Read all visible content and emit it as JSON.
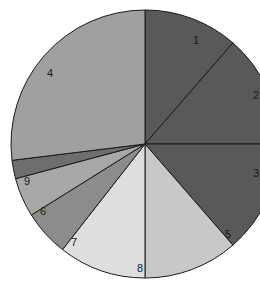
{
  "chart_data": {
    "type": "pie",
    "title": "",
    "subtitle": "",
    "xlabel": "",
    "ylabel": "",
    "legend": "none",
    "grid": false,
    "labels_visible": [
      "1",
      "2",
      "3",
      "4",
      "5",
      "6",
      "7",
      "8",
      "9"
    ],
    "note": "Grayscale pie chart with nine wedges labelled 1-9; wedge labels sit inside the slices. Wedges 2 and 3 labels are clipped by the right edge of the image.",
    "categories": [
      "1",
      "2",
      "3",
      "4",
      "5",
      "6",
      "7",
      "8",
      "9"
    ],
    "values": [
      23,
      14,
      14,
      23,
      12,
      4,
      5,
      13,
      2
    ],
    "start_angle_deg": 0,
    "direction": "clockwise",
    "slices": [
      {
        "label": "1",
        "value": 23,
        "percent": 22.7,
        "start_deg": 0,
        "end_deg": 41,
        "color": "#595959",
        "label_x": 196,
        "label_y": 40,
        "label_clipped": false
      },
      {
        "label": "2",
        "value": 14,
        "percent": 13.6,
        "start_deg": 41,
        "end_deg": 90,
        "color": "#595959",
        "label_x": 256,
        "label_y": 95,
        "label_clipped": true
      },
      {
        "label": "3",
        "value": 14,
        "percent": 13.6,
        "start_deg": 90,
        "end_deg": 139,
        "color": "#595959",
        "label_x": 256,
        "label_y": 173,
        "label_clipped": true
      },
      {
        "label": "5",
        "value": 12,
        "percent": 12.1,
        "start_deg": 139,
        "end_deg": 180,
        "color": "#c8c8c8",
        "label_x": 228,
        "label_y": 234,
        "label_clipped": false
      },
      {
        "label": "8",
        "value": 13,
        "percent": 12.9,
        "start_deg": 180,
        "end_deg": 218,
        "color": "#dedede",
        "label_x": 140,
        "label_y": 268,
        "label_clipped": false
      },
      {
        "label": "7",
        "value": 5,
        "percent": 5.1,
        "start_deg": 218,
        "end_deg": 238,
        "color": "#8c8c8c",
        "label_x": 74,
        "label_y": 242,
        "label_clipped": false
      },
      {
        "label": "6",
        "value": 4,
        "percent": 4.4,
        "start_deg": 238,
        "end_deg": 255,
        "color": "#a8a8a8",
        "label_x": 43,
        "label_y": 211,
        "label_clipped": false
      },
      {
        "label": "9",
        "value": 2,
        "percent": 2.0,
        "start_deg": 255,
        "end_deg": 263,
        "color": "#6e6e6e",
        "label_x": 27,
        "label_y": 181,
        "label_clipped": false
      },
      {
        "label": "4",
        "value": 23,
        "percent": 22.7,
        "start_deg": 263,
        "end_deg": 360,
        "color": "#a0a0a0",
        "label_x": 50,
        "label_y": 73,
        "label_clipped": false
      }
    ],
    "geometry": {
      "center_x": 145,
      "center_y": 144,
      "radius": 134,
      "stroke_color": "#1a1a1a",
      "stroke_width": 1,
      "background": "#ffffff"
    }
  }
}
